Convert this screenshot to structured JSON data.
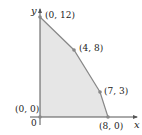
{
  "diagram": {
    "type": "feasible-region",
    "axes": {
      "x_label": "x",
      "y_label": "y",
      "origin_label": "0"
    },
    "vertices": [
      {
        "label": "(0, 0)",
        "x": 0,
        "y": 0
      },
      {
        "label": "(0, 12)",
        "x": 0,
        "y": 12
      },
      {
        "label": "(4, 8)",
        "x": 4,
        "y": 8
      },
      {
        "label": "(7, 3)",
        "x": 7,
        "y": 3
      },
      {
        "label": "(8, 0)",
        "x": 8,
        "y": 0
      }
    ],
    "colors": {
      "region_fill": "#e6e6e6",
      "boundary": "#888888",
      "axis": "#555555",
      "point": "#888888"
    }
  }
}
